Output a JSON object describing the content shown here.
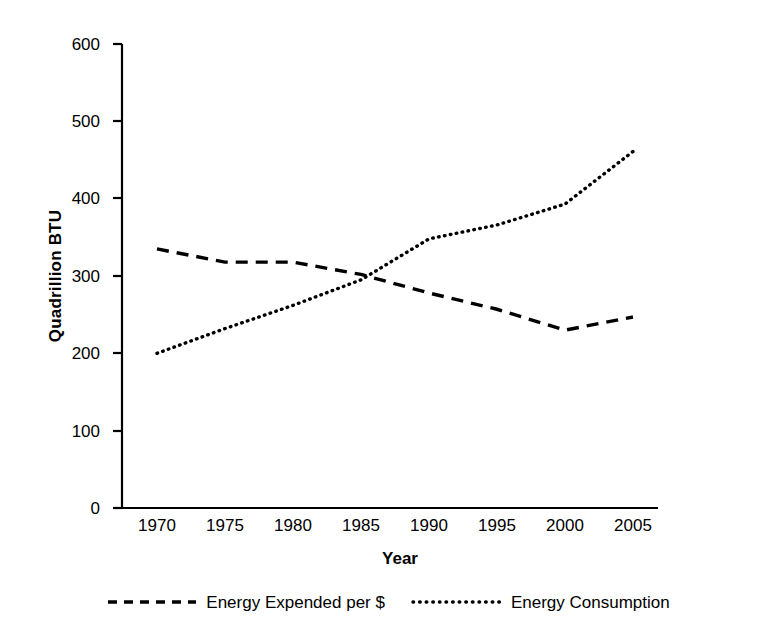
{
  "chart_data": {
    "type": "line",
    "title": "",
    "xlabel": "Year",
    "ylabel": "Quadrillion BTU",
    "x": [
      1970,
      1975,
      1980,
      1985,
      1990,
      1995,
      2000,
      2005
    ],
    "categories": [
      "1970",
      "1975",
      "1980",
      "1985",
      "1990",
      "1995",
      "2000",
      "2005"
    ],
    "xlim": [
      1970,
      2005
    ],
    "ylim": [
      0,
      600
    ],
    "yticks": [
      0,
      100,
      200,
      300,
      400,
      500,
      600
    ],
    "ytick_labels": [
      "0",
      "100",
      "200",
      "300",
      "400",
      "500",
      "600"
    ],
    "grid": false,
    "legend_position": "below",
    "series": [
      {
        "name": "Energy Expended per $",
        "style": "dashed",
        "color": "#000000",
        "values": [
          335,
          318,
          318,
          302,
          278,
          257,
          230,
          247
        ]
      },
      {
        "name": "Energy Consumption",
        "style": "dotted",
        "color": "#000000",
        "values": [
          200,
          232,
          262,
          295,
          348,
          366,
          393,
          461
        ]
      }
    ]
  },
  "axis": {
    "y_title": "Quadrillion BTU",
    "x_title": "Year",
    "y_tick_labels": [
      "600",
      "500",
      "400",
      "300",
      "200",
      "100",
      "0"
    ],
    "x_tick_labels": [
      "1970",
      "1975",
      "1980",
      "1985",
      "1990",
      "1995",
      "2000",
      "2005"
    ]
  },
  "legend": {
    "entries": [
      {
        "label": "Energy Expended per $",
        "marker": "dashed-line-swatch"
      },
      {
        "label": "Energy Consumption",
        "marker": "dotted-line-swatch"
      }
    ]
  },
  "colors": {
    "axis": "#000000",
    "series": "#000000",
    "background": "#ffffff"
  }
}
